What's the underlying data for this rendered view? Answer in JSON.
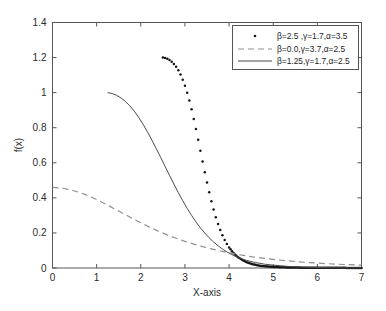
{
  "chart_data": {
    "type": "line",
    "title": "",
    "xlabel": "X-axis",
    "ylabel": "f(x)",
    "xlim": [
      0,
      7
    ],
    "ylim": [
      0,
      1.4
    ],
    "xticks": [
      "0",
      "1",
      "2",
      "3",
      "4",
      "5",
      "6",
      "7"
    ],
    "xtick_values": [
      0,
      1,
      2,
      3,
      4,
      5,
      6,
      7
    ],
    "yticks": [
      "0",
      "0.2",
      "0.4",
      "0.6",
      "0.8",
      "1",
      "1.2",
      "1.4"
    ],
    "ytick_values": [
      0,
      0.2,
      0.4,
      0.6,
      0.8,
      1.0,
      1.2,
      1.4
    ],
    "grid": false,
    "legend_position": "top-right",
    "series": [
      {
        "name": "β=2.5 ,γ=1.7,α=3.5",
        "style": "dotted",
        "marker": "dot",
        "color": "#151515",
        "x": [
          2.5,
          2.55,
          2.6,
          2.65,
          2.7,
          2.75,
          2.8,
          2.85,
          2.9,
          2.95,
          3.0,
          3.05,
          3.1,
          3.15,
          3.2,
          3.25,
          3.3,
          3.35,
          3.4,
          3.45,
          3.5,
          3.55,
          3.6,
          3.65,
          3.7,
          3.75,
          3.8,
          3.85,
          3.9,
          3.95,
          4.0,
          4.1,
          4.2,
          4.3,
          4.4,
          4.5,
          4.6,
          4.7,
          4.8,
          4.9,
          5.0,
          5.2,
          5.4,
          5.6,
          5.8,
          6.0,
          6.2,
          6.4,
          6.6,
          6.8,
          7.0
        ],
        "y": [
          1.2,
          1.198,
          1.193,
          1.186,
          1.176,
          1.163,
          1.147,
          1.127,
          1.103,
          1.074,
          1.04,
          1.0,
          0.955,
          0.905,
          0.85,
          0.792,
          0.731,
          0.669,
          0.607,
          0.546,
          0.487,
          0.432,
          0.38,
          0.333,
          0.29,
          0.251,
          0.217,
          0.187,
          0.16,
          0.137,
          0.117,
          0.085,
          0.062,
          0.045,
          0.033,
          0.024,
          0.018,
          0.013,
          0.01,
          0.008,
          0.006,
          0.004,
          0.003,
          0.002,
          0.002,
          0.001,
          0.001,
          0.001,
          0.001,
          0.0,
          0.0
        ]
      },
      {
        "name": "β=0.0,γ=3.7,α=2.5",
        "style": "dashed",
        "marker": "none",
        "color": "#8e8e8e",
        "x": [
          0.0,
          0.2,
          0.4,
          0.6,
          0.8,
          1.0,
          1.2,
          1.4,
          1.6,
          1.8,
          2.0,
          2.2,
          2.4,
          2.6,
          2.8,
          3.0,
          3.2,
          3.4,
          3.6,
          3.8,
          4.0,
          4.2,
          4.4,
          4.6,
          4.8,
          5.0,
          5.4,
          5.8,
          6.2,
          6.6,
          7.0
        ],
        "y": [
          0.46,
          0.456,
          0.447,
          0.432,
          0.413,
          0.39,
          0.365,
          0.338,
          0.311,
          0.284,
          0.258,
          0.233,
          0.21,
          0.189,
          0.17,
          0.152,
          0.136,
          0.122,
          0.109,
          0.097,
          0.087,
          0.077,
          0.069,
          0.061,
          0.055,
          0.049,
          0.039,
          0.031,
          0.025,
          0.02,
          0.016
        ]
      },
      {
        "name": "β=1.25,γ=1.7,α=2.5",
        "style": "solid",
        "marker": "none",
        "color": "#4a4a4a",
        "x": [
          1.25,
          1.35,
          1.45,
          1.55,
          1.65,
          1.75,
          1.85,
          1.95,
          2.05,
          2.15,
          2.25,
          2.35,
          2.45,
          2.55,
          2.65,
          2.75,
          2.85,
          2.95,
          3.05,
          3.15,
          3.25,
          3.35,
          3.45,
          3.55,
          3.65,
          3.75,
          3.85,
          3.95,
          4.05,
          4.2,
          4.4,
          4.6,
          4.8,
          5.0,
          5.4,
          5.8,
          6.2,
          6.6,
          7.0
        ],
        "y": [
          1.0,
          0.995,
          0.985,
          0.97,
          0.95,
          0.925,
          0.895,
          0.86,
          0.82,
          0.777,
          0.73,
          0.681,
          0.631,
          0.58,
          0.529,
          0.479,
          0.43,
          0.384,
          0.34,
          0.3,
          0.263,
          0.229,
          0.199,
          0.172,
          0.148,
          0.127,
          0.108,
          0.092,
          0.078,
          0.06,
          0.043,
          0.031,
          0.022,
          0.016,
          0.008,
          0.004,
          0.002,
          0.001,
          0.001
        ]
      }
    ]
  },
  "legend": {
    "entries": [
      {
        "label": "β=2.5 ,γ=1.7,α=3.5",
        "sample": "dotted"
      },
      {
        "label": "β=0.0,γ=3.7,α=2.5",
        "sample": "dashed"
      },
      {
        "label": "β=1.25,γ=1.7,α=2.5",
        "sample": "solid"
      }
    ]
  },
  "axes": {
    "x_title": "X-axis",
    "y_title": "f(x)"
  }
}
